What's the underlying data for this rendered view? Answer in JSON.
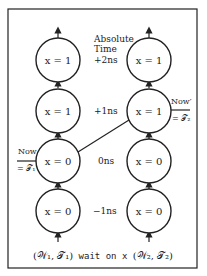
{
  "diagram": {
    "frame": {
      "x": 8,
      "y": 9,
      "width": 189,
      "height": 259,
      "stroke": "#222222"
    },
    "columns": [
      {
        "id": "thread-1",
        "cx": 58,
        "nodes": [
          {
            "label": "x = 1",
            "cy": 60
          },
          {
            "label": "x = 1",
            "cy": 111
          },
          {
            "label": "x = 0",
            "cy": 161
          },
          {
            "label": "x = 0",
            "cy": 211
          }
        ]
      },
      {
        "id": "thread-2",
        "cx": 149,
        "nodes": [
          {
            "label": "x = 1",
            "cy": 60
          },
          {
            "label": "x = 1",
            "cy": 111
          },
          {
            "label": "x = 0",
            "cy": 161
          },
          {
            "label": "x = 0",
            "cy": 211
          }
        ]
      }
    ],
    "time_axis": {
      "title_line1": "Absolute",
      "title_line2": "Time",
      "labels": [
        "+2ns",
        "+1ns",
        "0ns",
        "−1ns"
      ]
    },
    "now_marker_1": {
      "line1": "Now",
      "line2": "= 𝒯₁"
    },
    "now_marker_2": {
      "line1": "Now′",
      "line2": "= 𝒯₂"
    },
    "caption": {
      "left": "(𝒲₁, 𝒯₁)",
      "middle": " wait on x ",
      "right": "(𝒲₂, 𝒯₂)"
    },
    "link": {
      "from": "thread-1 node 3 (x = 0, 0ns)",
      "to": "thread-2 node 2 (x = 1, +1ns)"
    }
  }
}
